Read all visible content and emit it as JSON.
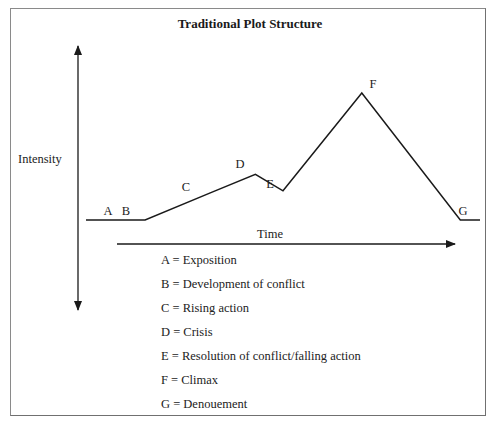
{
  "title": "Traditional Plot Structure",
  "axes": {
    "y_label": "Intensity",
    "x_label": "Time"
  },
  "plot_points": [
    {
      "key": "A",
      "t": 0.05,
      "intensity": 0.0
    },
    {
      "key": "B",
      "t": 0.15,
      "intensity": 0.0
    },
    {
      "key": "C",
      "t": 0.32,
      "intensity": 0.22
    },
    {
      "key": "D",
      "t": 0.43,
      "intensity": 0.36
    },
    {
      "key": "E",
      "t": 0.5,
      "intensity": 0.23
    },
    {
      "key": "F",
      "t": 0.7,
      "intensity": 1.0
    },
    {
      "key": "G",
      "t": 0.95,
      "intensity": 0.0
    }
  ],
  "point_labels": {
    "A": "A",
    "B": "B",
    "C": "C",
    "D": "D",
    "E": "E",
    "F": "F",
    "G": "G"
  },
  "legend": [
    {
      "key": "A",
      "text": "A = Exposition"
    },
    {
      "key": "B",
      "text": "B = Development of conflict"
    },
    {
      "key": "C",
      "text": "C = Rising action"
    },
    {
      "key": "D",
      "text": "D = Crisis"
    },
    {
      "key": "E",
      "text": "E = Resolution of conflict/falling action"
    },
    {
      "key": "F",
      "text": "F = Climax"
    },
    {
      "key": "G",
      "text": "G = Denouement"
    }
  ],
  "colors": {
    "line": "#1a1a1a",
    "frame": "#8a8a8a",
    "text": "#222222"
  }
}
